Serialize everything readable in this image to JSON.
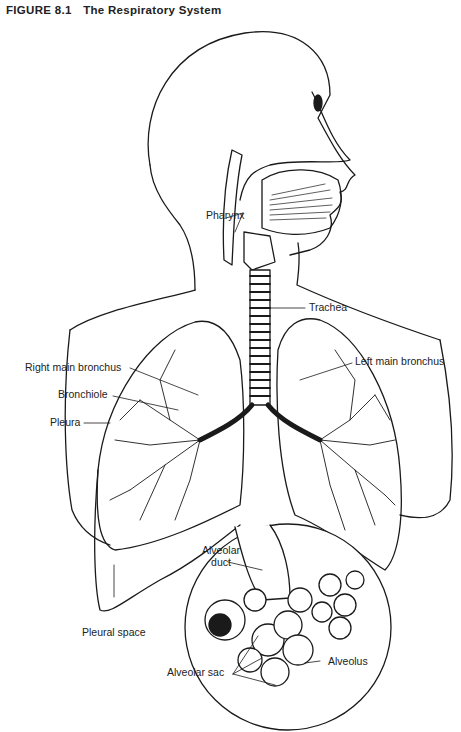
{
  "figure": {
    "number": "FIGURE 8.1",
    "title": "The Respiratory System"
  },
  "labels": {
    "pharynx": "Pharynx",
    "trachea": "Trachea",
    "right_main_bronchus": "Right main bronchus",
    "left_main_bronchus": "Left main bronchus",
    "bronchiole": "Bronchiole",
    "pleura": "Pleura",
    "pleural_space": "Pleural space",
    "alveolar_duct_line1": "Alveolar",
    "alveolar_duct_line2": "duct",
    "alveolar_sac": "Alveolar sac",
    "alveolus": "Alveolus"
  },
  "colors": {
    "ink": "#1a1a1a",
    "paper": "#ffffff"
  }
}
